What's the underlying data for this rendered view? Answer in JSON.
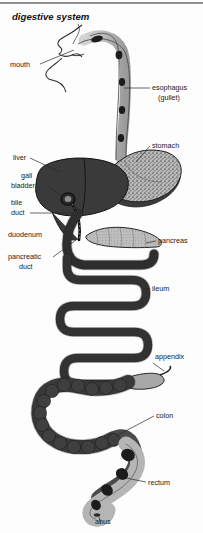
{
  "figure": {
    "title": "digestive system",
    "background_color": "#fdfdfd",
    "ink_color": "#1a1a1a",
    "width": 203,
    "height": 533
  },
  "palette": {
    "liver_dark": "#3a3a3a",
    "colon_dark": "#454545",
    "stomach_speckle": "#8d8d8d",
    "pancreas_light": "#b0b0b0",
    "esophagus_light": "#bdbdbd",
    "rectum_light": "#b5b5b5",
    "outline": "#1f1f1f",
    "leader_line": "#2a2a2a"
  },
  "labels": [
    {
      "id": "mouth",
      "text": "mouth",
      "side": "left",
      "x": 10,
      "y": 67
    },
    {
      "id": "esophagus",
      "text": "esophagus",
      "side": "right",
      "x": 152,
      "y": 90
    },
    {
      "id": "esophagus_alt",
      "text": "(gullet)",
      "side": "right",
      "x": 158,
      "y": 100
    },
    {
      "id": "stomach",
      "text": "stomach",
      "side": "right",
      "x": 152,
      "y": 148
    },
    {
      "id": "liver",
      "text": "liver",
      "side": "left",
      "x": 13,
      "y": 160
    },
    {
      "id": "gall",
      "text": "gall",
      "side": "left",
      "x": 21,
      "y": 178
    },
    {
      "id": "bladder",
      "text": "bladder",
      "side": "left",
      "x": 11,
      "y": 188
    },
    {
      "id": "bile",
      "text": "bile",
      "side": "left",
      "x": 11,
      "y": 205
    },
    {
      "id": "duct",
      "text": "duct",
      "side": "left",
      "x": 11,
      "y": 215
    },
    {
      "id": "duodenum",
      "text": "duodenum",
      "side": "left",
      "x": 8,
      "y": 237
    },
    {
      "id": "pancreas",
      "text": "pancreas",
      "side": "right",
      "x": 158,
      "y": 243
    },
    {
      "id": "pancreatic",
      "text": "pancreatic",
      "side": "left",
      "x": 8,
      "y": 259
    },
    {
      "id": "pancreatic_2",
      "text": "duct",
      "side": "left",
      "x": 19,
      "y": 269
    },
    {
      "id": "ileum",
      "text": "ileum",
      "side": "right",
      "x": 152,
      "y": 291
    },
    {
      "id": "appendix",
      "text": "appendix",
      "side": "right",
      "x": 155,
      "y": 359
    },
    {
      "id": "colon",
      "text": "colon",
      "side": "right",
      "x": 156,
      "y": 418
    },
    {
      "id": "rectum",
      "text": "rectum",
      "side": "right",
      "x": 148,
      "y": 485
    },
    {
      "id": "anus",
      "text": "ahus",
      "side": "bottom",
      "x": 95,
      "y": 524
    }
  ],
  "organs": [
    {
      "id": "mouth-profile",
      "name": "mouth and face profile",
      "shading": "line-art"
    },
    {
      "id": "esophagus-tube",
      "name": "esophagus (gullet)",
      "shading": "light-gray with dark food boluses"
    },
    {
      "id": "stomach-body",
      "name": "stomach",
      "shading": "speckled gray"
    },
    {
      "id": "liver-body",
      "name": "liver",
      "shading": "dark gray"
    },
    {
      "id": "gall-bladder",
      "name": "gall bladder",
      "shading": "dark gray"
    },
    {
      "id": "bile-duct",
      "name": "bile duct",
      "shading": "dark outline"
    },
    {
      "id": "duodenum-loop",
      "name": "duodenum",
      "shading": "dark gray"
    },
    {
      "id": "pancreas-body",
      "name": "pancreas",
      "shading": "light gray lobed"
    },
    {
      "id": "ileum-coils",
      "name": "ileum",
      "shading": "dark gray zigzag"
    },
    {
      "id": "appendix-tail",
      "name": "appendix",
      "shading": "light gray"
    },
    {
      "id": "colon-loop",
      "name": "colon",
      "shading": "dark gray haustrated"
    },
    {
      "id": "rectum-body",
      "name": "rectum",
      "shading": "light gray with dark faeces"
    },
    {
      "id": "anus-opening",
      "name": "anus",
      "shading": "small dark opening"
    }
  ]
}
